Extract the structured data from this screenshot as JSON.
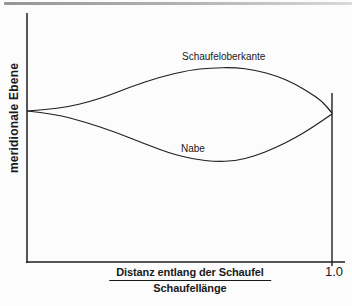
{
  "figure": {
    "background": "#fcfcfc",
    "ink_color": "#1f1f1f",
    "top_rule_color_left": "#96969a",
    "top_rule_color_right": "#d9d9db"
  },
  "labels": {
    "y_axis": "meridionale Ebene",
    "upper_curve": "Schaufeloberkante",
    "lower_curve": "Nabe",
    "x_axis_numerator": "Distanz entlang der Schaufel",
    "x_axis_denominator": "Schaufellänge",
    "x_max_tick": "1.0"
  },
  "chart_data": {
    "type": "line",
    "title": "",
    "xlabel": "Distanz entlang der Schaufel / Schaufellänge",
    "ylabel": "meridionale Ebene",
    "xlim": [
      0,
      1.0
    ],
    "ylim": [
      -0.7,
      0.7
    ],
    "x_tick_labels": [
      "1.0"
    ],
    "grid": false,
    "legend_position": "inline-annotations",
    "note": "Qualitative sketch of blade outline in the meridional plane; y in arbitrary units relative to the leading/trailing edge line; curves meet at x=0 and x=1.0.",
    "series": [
      {
        "name": "Schaufeloberkante",
        "points": [
          [
            0.0,
            0.0
          ],
          [
            0.108,
            0.02
          ],
          [
            0.239,
            0.12
          ],
          [
            0.338,
            0.24
          ],
          [
            0.436,
            0.34
          ],
          [
            0.534,
            0.41
          ],
          [
            0.6,
            0.43
          ],
          [
            0.682,
            0.435
          ],
          [
            0.748,
            0.41
          ],
          [
            0.82,
            0.35
          ],
          [
            0.879,
            0.27
          ],
          [
            0.928,
            0.18
          ],
          [
            0.967,
            0.1
          ],
          [
            1.0,
            -0.02
          ]
        ]
      },
      {
        "name": "Nabe",
        "points": [
          [
            0.0,
            0.0
          ],
          [
            0.092,
            -0.03
          ],
          [
            0.19,
            -0.11
          ],
          [
            0.289,
            -0.21
          ],
          [
            0.387,
            -0.33
          ],
          [
            0.485,
            -0.44
          ],
          [
            0.567,
            -0.49
          ],
          [
            0.616,
            -0.505
          ],
          [
            0.682,
            -0.5
          ],
          [
            0.748,
            -0.45
          ],
          [
            0.813,
            -0.37
          ],
          [
            0.879,
            -0.27
          ],
          [
            0.938,
            -0.16
          ],
          [
            1.0,
            -0.03
          ]
        ]
      }
    ]
  }
}
